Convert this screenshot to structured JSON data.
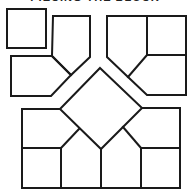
{
  "title": "PIECING THE BLOCK",
  "diagram": {
    "stroke_color": "#1a1a1a",
    "background": "#ffffff",
    "units": [
      {
        "name": "corner-square",
        "shape": "square"
      },
      {
        "name": "top-left-pentagon",
        "shape": "pentagon"
      },
      {
        "name": "left-pentagon",
        "shape": "pentagon"
      },
      {
        "name": "top-right-unit",
        "shape": "square + two pentagons"
      },
      {
        "name": "center-diamond",
        "shape": "diamond"
      },
      {
        "name": "bottom-unit",
        "shape": "two squares + three pentagons"
      }
    ]
  }
}
